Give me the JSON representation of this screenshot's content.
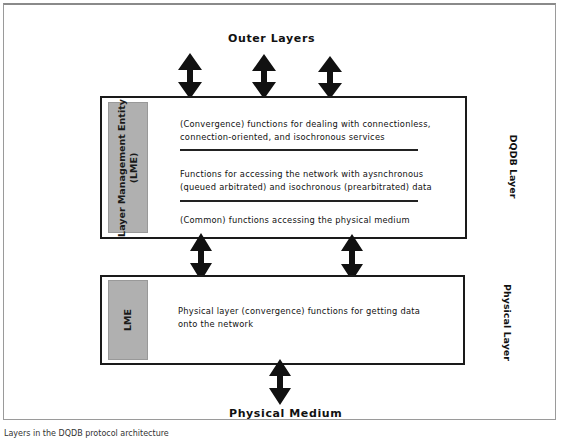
{
  "diagram": {
    "type": "layered-architecture",
    "top_label": "Outer Layers",
    "bottom_label": "Physical Medium",
    "dqdb_layer": {
      "side_label": "DQDB Layer",
      "lme_label_line1": "Layer Management Entity",
      "lme_label_line2": "(LME)",
      "functions": [
        {
          "line1": "(Convergence) functions for dealing with connectionless,",
          "line2": "connection-oriented, and isochronous services"
        },
        {
          "line1": "Functions for accessing the network with aysnchronous",
          "line2": "(queued arbitrated) and isochronous (prearbitrated) data"
        },
        {
          "line1": "(Common) functions accessing the physical medium",
          "line2": ""
        }
      ]
    },
    "physical_layer": {
      "side_label": "Physical Layer",
      "lme_label": "LME",
      "function_line1": "Physical layer (convergence) functions for getting data",
      "function_line2": "onto the network"
    },
    "arrows": {
      "outer_to_dqdb_count": 3,
      "dqdb_to_physical_count": 2,
      "physical_to_medium_count": 1
    },
    "colors": {
      "box_border": "#1a1a1a",
      "lme_fill": "#b0b0b0",
      "arrow": "#111111"
    }
  },
  "caption": "Layers in the DQDB protocol architecture"
}
